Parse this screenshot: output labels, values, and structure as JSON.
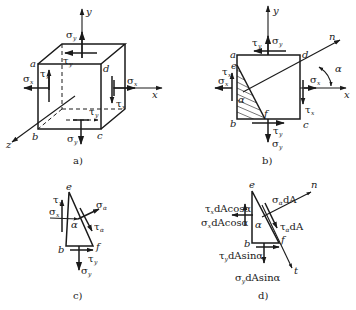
{
  "figure": {
    "panels": [
      {
        "id": "a",
        "caption": "a)",
        "description": "3D element cube with stresses",
        "axes": {
          "x": "x",
          "y": "y",
          "z": "z"
        },
        "vertices": {
          "a": "a",
          "b": "b",
          "c": "c",
          "d": "d"
        },
        "stresses": {
          "sigma_y_top": {
            "sym": "σ",
            "sub": "y"
          },
          "tau_y_top": {
            "sym": "τ",
            "sub": "y"
          },
          "sigma_x_left": {
            "sym": "σ",
            "sub": "x"
          },
          "tau_x_left": {
            "sym": "τ",
            "sub": "x"
          },
          "sigma_x_right": {
            "sym": "σ",
            "sub": "x"
          },
          "tau_x_right": {
            "sym": "τ",
            "sub": "x"
          },
          "tau_y_bottom": {
            "sym": "τ",
            "sub": "y"
          },
          "sigma_y_bottom": {
            "sym": "σ",
            "sub": "y"
          }
        }
      },
      {
        "id": "b",
        "caption": "b)",
        "description": "Plane stress element with inclined section ef",
        "axes": {
          "x": "x",
          "y": "y",
          "n": "n"
        },
        "vertices": {
          "a": "a",
          "b": "b",
          "c": "c",
          "d": "d",
          "e": "e",
          "f": "f"
        },
        "angle": "α",
        "stresses": {
          "sigma_y_top": {
            "sym": "σ",
            "sub": "y"
          },
          "tau_y_top": {
            "sym": "τ",
            "sub": "y"
          },
          "sigma_x_left": {
            "sym": "σ",
            "sub": "x"
          },
          "tau_x_left": {
            "sym": "τ",
            "sub": "x"
          },
          "sigma_x_right": {
            "sym": "σ",
            "sub": "x"
          },
          "tau_x_right": {
            "sym": "τ",
            "sub": "x"
          },
          "tau_y_bottom": {
            "sym": "τ",
            "sub": "y"
          },
          "sigma_y_bottom": {
            "sym": "σ",
            "sub": "y"
          }
        }
      },
      {
        "id": "c",
        "caption": "c)",
        "description": "Free body of triangular wedge ebf",
        "vertices": {
          "e": "e",
          "b": "b",
          "f": "f"
        },
        "angle": "α",
        "stresses": {
          "tau_x": {
            "sym": "τ",
            "sub": "x"
          },
          "sigma_x": {
            "sym": "σ",
            "sub": "x"
          },
          "sigma_alpha": {
            "sym": "σ",
            "sub": "α"
          },
          "tau_alpha": {
            "sym": "τ",
            "sub": "α"
          },
          "tau_y": {
            "sym": "τ",
            "sub": "y"
          },
          "sigma_y": {
            "sym": "σ",
            "sub": "y"
          }
        }
      },
      {
        "id": "d",
        "caption": "d)",
        "description": "Forces on wedge ebf",
        "vertices": {
          "e": "e",
          "b": "b",
          "f": "f"
        },
        "axes": {
          "n": "n",
          "t": "t"
        },
        "angle": "α",
        "forces": {
          "tau_x": {
            "sym": "τ",
            "sub": "x",
            "tail": "dAcosα"
          },
          "sigma_x": {
            "sym": "σ",
            "sub": "x",
            "tail": "dAcosα"
          },
          "sigma_alpha": {
            "sym": "σ",
            "sub": "α",
            "tail": "dA"
          },
          "tau_alpha": {
            "sym": "τ",
            "sub": "α",
            "tail": "dA"
          },
          "tau_y": {
            "sym": "τ",
            "sub": "y",
            "tail": "dAsinα"
          },
          "sigma_y": {
            "sym": "σ",
            "sub": "y",
            "tail": "dAsinα"
          }
        }
      }
    ]
  }
}
